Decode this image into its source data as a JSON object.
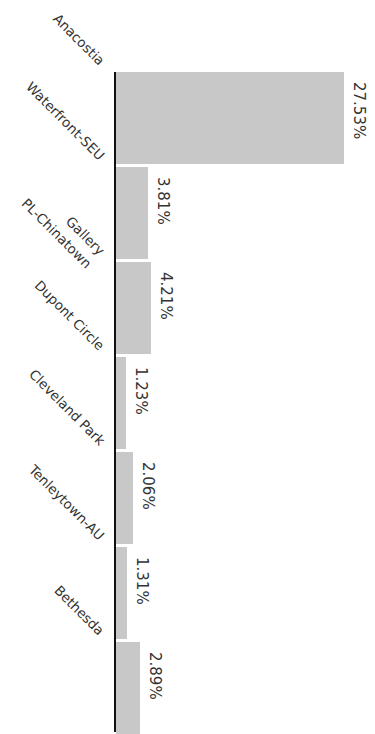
{
  "chart_data": {
    "type": "bar",
    "orientation": "horizontal (rotated 90deg)",
    "title": "",
    "xlabel": "",
    "ylabel": "",
    "categories": [
      "Anacostia",
      "Waterfront-SEU",
      "Gallery PL-Chinatown",
      "Dupont Circle",
      "Cleveland Park",
      "Tenleytown-AU",
      "Bethesda"
    ],
    "values": [
      27.53,
      3.81,
      4.21,
      1.23,
      2.06,
      1.31,
      2.89
    ],
    "value_labels": [
      "27.53%",
      "3.81%",
      "4.21%",
      "1.23%",
      "2.06%",
      "1.31%",
      "2.89%"
    ],
    "grid": false,
    "legend": null,
    "bar_color": "#c8c8c8",
    "axis_color": "#111111"
  },
  "labels": {
    "cat0": "Anacostia",
    "cat1": "Waterfront-SEU",
    "cat2a": "Gallery",
    "cat2b": "PL-Chinatown",
    "cat3": "Dupont Circle",
    "cat4": "Cleveland Park",
    "cat5": "Tenleytown-AU",
    "cat6": "Bethesda",
    "val0": "27.53%",
    "val1": "3.81%",
    "val2": "4.21%",
    "val3": "1.23%",
    "val4": "2.06%",
    "val5": "1.31%",
    "val6": "2.89%"
  }
}
